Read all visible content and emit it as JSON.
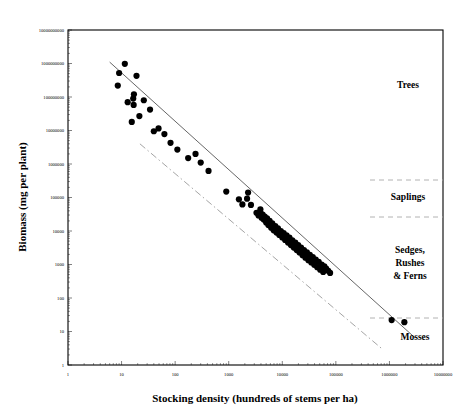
{
  "chart_data": {
    "type": "scatter",
    "title": "",
    "xlabel": "Stocking density (hundreds of stems per ha)",
    "ylabel": "Biomass (mg per plant)",
    "xscale": "log",
    "yscale": "log",
    "xlim": [
      1,
      10000000
    ],
    "ylim": [
      1,
      10000000000
    ],
    "grid": false,
    "legend_position": "none",
    "xticks": [
      "1",
      "10",
      "100",
      "1000",
      "10000",
      "100000",
      "1000000",
      "10000000"
    ],
    "xtick_values": [
      1,
      10,
      100,
      1000,
      10000,
      100000,
      1000000,
      10000000
    ],
    "yticks": [
      "1",
      "10",
      "100",
      "1000",
      "10000",
      "100000",
      "1000000",
      "10000000",
      "100000000",
      "1000000000",
      "10000000000"
    ],
    "ytick_values": [
      1,
      10,
      100,
      1000,
      10000,
      100000,
      1000000,
      10000000,
      100000000,
      1000000000,
      10000000000
    ],
    "points": [
      [
        8.5,
        220000000
      ],
      [
        11.5,
        980000000
      ],
      [
        9.0,
        520000000
      ],
      [
        13.0,
        70000000
      ],
      [
        19.0,
        430000000
      ],
      [
        16.5,
        90000000
      ],
      [
        16.8,
        58000000
      ],
      [
        17.0,
        120000000
      ],
      [
        26.0,
        80000000
      ],
      [
        21.5,
        27000000
      ],
      [
        15.5,
        18000000
      ],
      [
        34.0,
        42000000
      ],
      [
        40.0,
        9500000
      ],
      [
        49.0,
        11500000
      ],
      [
        63.0,
        7800000
      ],
      [
        82.0,
        4300000
      ],
      [
        110.0,
        2700000
      ],
      [
        175.0,
        1500000
      ],
      [
        240.0,
        2000000
      ],
      [
        300.0,
        1100000
      ],
      [
        420.0,
        620000
      ],
      [
        900.0,
        150000
      ],
      [
        1550.0,
        88000
      ],
      [
        1800.0,
        62000
      ],
      [
        2200.0,
        92000
      ],
      [
        2300.0,
        140000
      ],
      [
        2600.0,
        60000
      ],
      [
        3300.0,
        35000
      ],
      [
        3600.0,
        29000
      ],
      [
        3900.0,
        44000
      ],
      [
        4000.0,
        33000
      ],
      [
        4100.0,
        25000
      ],
      [
        4300.0,
        31000
      ],
      [
        4500.0,
        22000
      ],
      [
        4700.0,
        27000
      ],
      [
        5000.0,
        18000
      ],
      [
        5200.0,
        24000
      ],
      [
        5500.0,
        15000
      ],
      [
        5800.0,
        20000
      ],
      [
        6200.0,
        12500
      ],
      [
        6500.0,
        17000
      ],
      [
        6900.0,
        10500
      ],
      [
        7400.0,
        14000
      ],
      [
        7800.0,
        9000
      ],
      [
        8300.0,
        12000
      ],
      [
        8800.0,
        7600
      ],
      [
        9400.0,
        10000
      ],
      [
        10000.0,
        6400
      ],
      [
        10600.0,
        8600
      ],
      [
        11300.0,
        5400
      ],
      [
        12000.0,
        7400
      ],
      [
        12800.0,
        4500
      ],
      [
        13600.0,
        6300
      ],
      [
        14500.0,
        3800
      ],
      [
        15400.0,
        5300
      ],
      [
        16400.0,
        3200
      ],
      [
        17500.0,
        4500
      ],
      [
        18600.0,
        2700
      ],
      [
        19800.0,
        3800
      ],
      [
        21000.0,
        2300
      ],
      [
        22400.0,
        3200
      ],
      [
        23900.0,
        1900
      ],
      [
        25400.0,
        2700
      ],
      [
        27000.0,
        1600
      ],
      [
        28800.0,
        2300
      ],
      [
        30700.0,
        1350
      ],
      [
        32700.0,
        1950
      ],
      [
        34800.0,
        1150
      ],
      [
        37100.0,
        1650
      ],
      [
        39500.0,
        980
      ],
      [
        42100.0,
        1400
      ],
      [
        44900.0,
        830
      ],
      [
        47800.0,
        1200
      ],
      [
        51000.0,
        700
      ],
      [
        54300.0,
        1000
      ],
      [
        58000.0,
        600
      ],
      [
        61000.0,
        880
      ],
      [
        66000.0,
        760
      ],
      [
        72000.0,
        650
      ],
      [
        78000.0,
        560
      ],
      [
        1100000.0,
        22
      ],
      [
        1900000.0,
        19
      ]
    ],
    "fit_line": {
      "name": "regression-line",
      "x": [
        6.0,
        3000000.0
      ],
      "y": [
        1100000000,
        6.5
      ],
      "style": "solid"
    },
    "reference_line": {
      "name": "reference-line",
      "x": [
        22.0,
        700000.0
      ],
      "y": [
        4000000,
        3.2
      ],
      "style": "dash-dot"
    },
    "annotations": [
      {
        "label": "Trees",
        "x_px": 408,
        "y_px": 88
      },
      {
        "label": "Saplings",
        "x_px": 408,
        "y_px": 200
      },
      {
        "label": "Sedges,",
        "x_px": 410,
        "y_px": 253
      },
      {
        "label": "Rushes",
        "x_px": 410,
        "y_px": 266
      },
      {
        "label": "& Ferns",
        "x_px": 410,
        "y_px": 279
      },
      {
        "label": "Mosses",
        "x_px": 415,
        "y_px": 340
      }
    ],
    "region_dividers": [
      {
        "name": "saplings-upper-divider",
        "y_px": 180
      },
      {
        "name": "saplings-lower-divider",
        "y_px": 217
      },
      {
        "name": "mosses-upper-divider",
        "y_px": 318
      }
    ]
  }
}
